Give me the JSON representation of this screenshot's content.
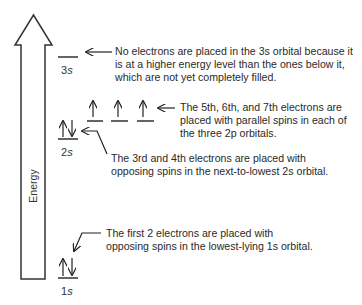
{
  "axis": {
    "label": "Energy"
  },
  "orbitals": [
    {
      "name": "3s",
      "num": "3",
      "sub": "s",
      "electrons": ""
    },
    {
      "name": "2p",
      "num": "2",
      "sub": "p",
      "electrons": "↑ ↑ ↑"
    },
    {
      "name": "2s",
      "num": "2",
      "sub": "s",
      "electrons": "↑↓"
    },
    {
      "name": "1s",
      "num": "1",
      "sub": "s",
      "electrons": "↑↓"
    }
  ],
  "notes": {
    "n3s": "No electrons are placed in the 3s orbital because it\nis at a higher energy level than the ones below it,\nwhich are not yet completely filled.",
    "n2p": "The 5th, 6th, and 7th electrons are\nplaced with parallel spins in each of\nthe three 2p orbitals.",
    "n2s": "The 3rd and 4th electrons are placed with\nopposing spins in the next-to-lowest 2s orbital.",
    "n1s": "The first 2 electrons are placed with\nopposing spins in the lowest-lying 1s orbital."
  },
  "colors": {
    "line": "#222222",
    "text": "#2a2a2a"
  }
}
